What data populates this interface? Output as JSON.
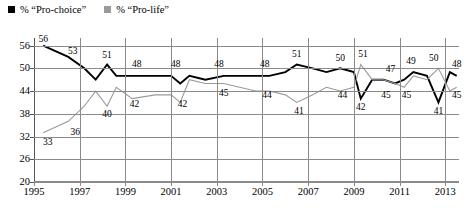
{
  "legend": {
    "entries": [
      {
        "label": "% “Pro-choice”",
        "color": "#000000",
        "key": "pro_choice"
      },
      {
        "label": "% “Pro-life”",
        "color": "#9a9a9a",
        "key": "pro_life"
      }
    ]
  },
  "chart_data": {
    "type": "line",
    "title": "",
    "xlabel": "",
    "ylabel": "",
    "xlim": [
      1995,
      2013.6
    ],
    "ylim": [
      20,
      58
    ],
    "grid": true,
    "legend_position": "top-left",
    "ytick_labels": [
      20,
      26,
      32,
      38,
      44,
      50,
      56
    ],
    "xtick_labels": [
      1995,
      1997,
      1999,
      2001,
      2003,
      2005,
      2007,
      2009,
      2011,
      2013
    ],
    "series": [
      {
        "name": "% “Pro-choice”",
        "color": "#000000",
        "x": [
          1995.4,
          1996.5,
          1997.2,
          1997.7,
          1998.2,
          1998.6,
          1999.3,
          2000.3,
          2001.0,
          2001.4,
          2001.8,
          2002.5,
          2003.3,
          2004.0,
          2004.7,
          2005.3,
          2006.0,
          2006.5,
          2007.2,
          2007.8,
          2008.4,
          2009.0,
          2009.3,
          2009.8,
          2010.3,
          2010.8,
          2011.2,
          2011.6,
          2012.2,
          2012.7,
          2013.2,
          2013.5
        ],
        "values": [
          56,
          53,
          50,
          47,
          51,
          48,
          48,
          48,
          48,
          46,
          48,
          47,
          48,
          48,
          48,
          48,
          49,
          51,
          50,
          49,
          50,
          49,
          42,
          47,
          47,
          46,
          47,
          49,
          48,
          41,
          49,
          48
        ]
      },
      {
        "name": "% “Pro-life”",
        "color": "#9a9a9a",
        "x": [
          1995.4,
          1996.5,
          1997.2,
          1997.7,
          1998.2,
          1998.6,
          1999.3,
          2000.3,
          2001.0,
          2001.4,
          2001.8,
          2002.5,
          2003.3,
          2004.0,
          2004.7,
          2005.3,
          2006.0,
          2006.5,
          2007.2,
          2007.8,
          2008.4,
          2009.0,
          2009.3,
          2009.8,
          2010.3,
          2010.8,
          2011.2,
          2011.6,
          2012.2,
          2012.7,
          2013.2,
          2013.5
        ],
        "values": [
          33,
          36,
          40,
          44,
          40,
          45,
          42,
          43,
          43,
          41,
          47,
          46,
          46,
          45,
          44,
          44,
          43,
          41,
          43,
          45,
          44,
          45,
          51,
          47,
          47,
          46,
          45,
          48,
          47,
          50,
          44,
          45
        ]
      }
    ],
    "point_labels": [
      {
        "text": "56",
        "series": "pro_choice",
        "x": 1995.4,
        "y": 57.4
      },
      {
        "text": "53",
        "series": "pro_choice",
        "x": 1996.7,
        "y": 54.4
      },
      {
        "text": "51",
        "series": "pro_choice",
        "x": 1998.2,
        "y": 53.2
      },
      {
        "text": "48",
        "series": "pro_choice",
        "x": 1999.5,
        "y": 50.9
      },
      {
        "text": "48",
        "series": "pro_choice",
        "x": 2001.2,
        "y": 50.9
      },
      {
        "text": "48",
        "series": "pro_choice",
        "x": 2003.1,
        "y": 50.9
      },
      {
        "text": "48",
        "series": "pro_choice",
        "x": 2005.1,
        "y": 50.9
      },
      {
        "text": "51",
        "series": "pro_choice",
        "x": 2006.5,
        "y": 53.4
      },
      {
        "text": "50",
        "series": "pro_choice",
        "x": 2008.4,
        "y": 52.5
      },
      {
        "text": "42",
        "series": "pro_choice",
        "x": 2009.3,
        "y": 39.4
      },
      {
        "text": "47",
        "series": "pro_choice",
        "x": 2010.6,
        "y": 49.6
      },
      {
        "text": "49",
        "series": "pro_choice",
        "x": 2011.5,
        "y": 51.7
      },
      {
        "text": "41",
        "series": "pro_choice",
        "x": 2012.7,
        "y": 38.5
      },
      {
        "text": "48",
        "series": "pro_choice",
        "x": 2013.5,
        "y": 50.9
      },
      {
        "text": "33",
        "series": "pro_life",
        "x": 1995.6,
        "y": 30.4
      },
      {
        "text": "36",
        "series": "pro_life",
        "x": 1996.8,
        "y": 32.8
      },
      {
        "text": "40",
        "series": "pro_life",
        "x": 1998.2,
        "y": 37.6
      },
      {
        "text": "42",
        "series": "pro_life",
        "x": 1999.4,
        "y": 40.3
      },
      {
        "text": "42",
        "series": "pro_life",
        "x": 2001.5,
        "y": 40.3
      },
      {
        "text": "45",
        "series": "pro_life",
        "x": 2003.3,
        "y": 43.1
      },
      {
        "text": "44",
        "series": "pro_life",
        "x": 2005.2,
        "y": 42.6
      },
      {
        "text": "41",
        "series": "pro_life",
        "x": 2006.6,
        "y": 38.4
      },
      {
        "text": "44",
        "series": "pro_life",
        "x": 2008.5,
        "y": 42.6
      },
      {
        "text": "51",
        "series": "pro_life",
        "x": 2009.4,
        "y": 53.4
      },
      {
        "text": "45",
        "series": "pro_life",
        "x": 2010.4,
        "y": 42.6
      },
      {
        "text": "45",
        "series": "pro_life",
        "x": 2011.3,
        "y": 42.6
      },
      {
        "text": "50",
        "series": "pro_life",
        "x": 2012.5,
        "y": 52.5
      },
      {
        "text": "45",
        "series": "pro_life",
        "x": 2013.5,
        "y": 42.6
      }
    ]
  }
}
